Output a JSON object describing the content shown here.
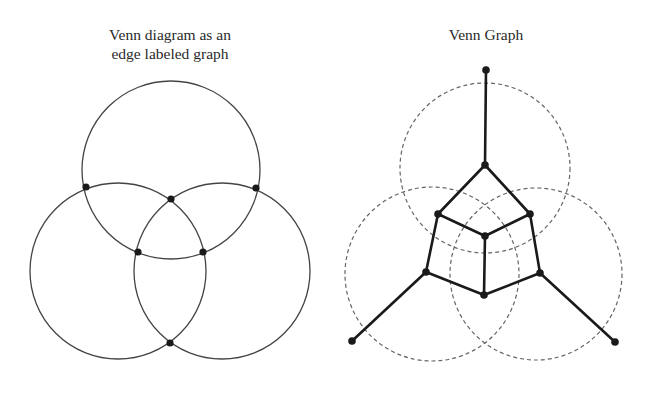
{
  "left_panel": {
    "title_line1": "Venn diagram as an",
    "title_line2": "edge labeled graph",
    "circles": [
      {
        "cx": 171,
        "cy": 170,
        "r": 89
      },
      {
        "cx": 118,
        "cy": 271,
        "r": 88
      },
      {
        "cx": 222,
        "cy": 271,
        "r": 88
      }
    ],
    "nodes": [
      [
        86,
        187
      ],
      [
        171,
        199
      ],
      [
        256,
        188
      ],
      [
        138,
        252
      ],
      [
        203,
        252
      ],
      [
        170,
        343
      ]
    ]
  },
  "right_panel": {
    "title": "Venn Graph",
    "circles": [
      {
        "cx": 485,
        "cy": 168,
        "r": 85
      },
      {
        "cx": 432,
        "cy": 274,
        "r": 87
      },
      {
        "cx": 536,
        "cy": 274,
        "r": 86
      }
    ],
    "nodes": [
      [
        486,
        70
      ],
      [
        485,
        165
      ],
      [
        438,
        214
      ],
      [
        530,
        214
      ],
      [
        485,
        236
      ],
      [
        426,
        272
      ],
      [
        540,
        273
      ],
      [
        484,
        295
      ],
      [
        352,
        341
      ],
      [
        615,
        342
      ]
    ],
    "edges": [
      [
        0,
        1
      ],
      [
        1,
        2
      ],
      [
        1,
        3
      ],
      [
        2,
        4
      ],
      [
        3,
        4
      ],
      [
        2,
        5
      ],
      [
        3,
        6
      ],
      [
        4,
        7
      ],
      [
        5,
        7
      ],
      [
        6,
        7
      ],
      [
        5,
        8
      ],
      [
        6,
        9
      ]
    ]
  },
  "colors": {
    "line": "#444444",
    "node": "#1a1a1a",
    "dashed": "#666666",
    "edge": "#1a1a1a"
  }
}
